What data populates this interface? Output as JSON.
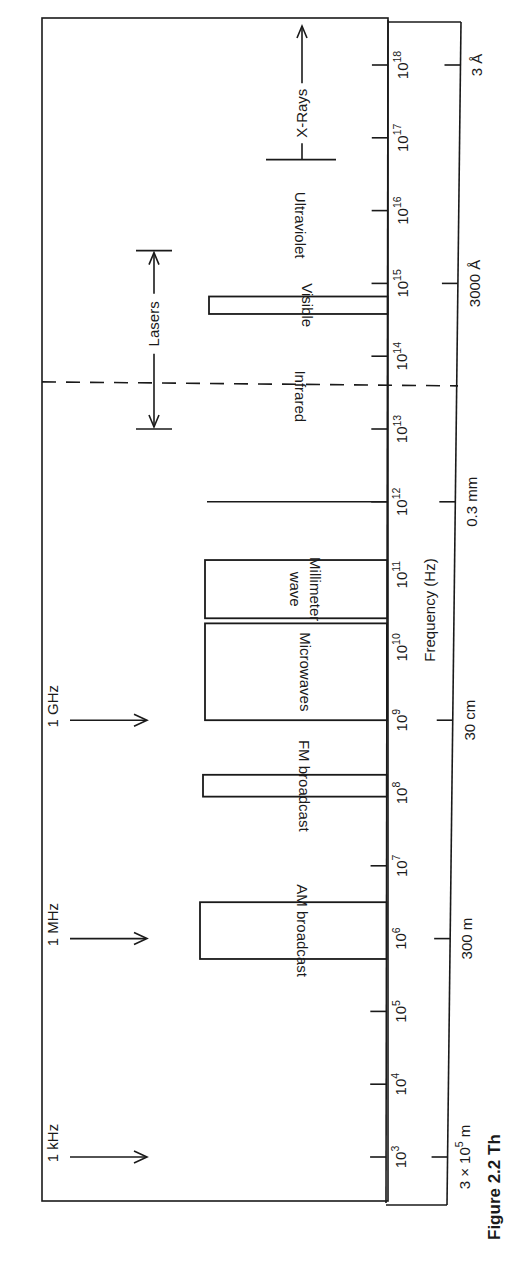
{
  "figure": {
    "caption_partial": "Figure 2.2 Th",
    "orientation": "rotated 90° clockwise on page",
    "frequency_axis": {
      "label": "Frequency (Hz)",
      "scale": "log10",
      "ticks": [
        {
          "exp": 3,
          "label": "10",
          "sup": "3"
        },
        {
          "exp": 4,
          "label": "10",
          "sup": "4"
        },
        {
          "exp": 5,
          "label": "10",
          "sup": "5"
        },
        {
          "exp": 6,
          "label": "10",
          "sup": "6"
        },
        {
          "exp": 7,
          "label": "10",
          "sup": "7"
        },
        {
          "exp": 8,
          "label": "10",
          "sup": "8"
        },
        {
          "exp": 9,
          "label": "10",
          "sup": "9"
        },
        {
          "exp": 10,
          "label": "10",
          "sup": "10"
        },
        {
          "exp": 11,
          "label": "10",
          "sup": "11"
        },
        {
          "exp": 12,
          "label": "10",
          "sup": "12"
        },
        {
          "exp": 13,
          "label": "10",
          "sup": "13"
        },
        {
          "exp": 14,
          "label": "10",
          "sup": "14"
        },
        {
          "exp": 15,
          "label": "10",
          "sup": "15"
        },
        {
          "exp": 16,
          "label": "10",
          "sup": "16"
        },
        {
          "exp": 17,
          "label": "10",
          "sup": "17"
        },
        {
          "exp": 18,
          "label": "10",
          "sup": "18"
        }
      ]
    },
    "wavelength_axis": {
      "ticks": [
        {
          "exp": 3,
          "label": "3 × 10",
          "sup": "5",
          "unit": " m"
        },
        {
          "exp": 6,
          "label": "300 m",
          "sup": "",
          "unit": ""
        },
        {
          "exp": 9,
          "label": "30 cm",
          "sup": "",
          "unit": ""
        },
        {
          "exp": 12,
          "label": "0.3 mm",
          "sup": "",
          "unit": ""
        },
        {
          "exp": 15,
          "label": "3000 Å",
          "sup": "",
          "unit": ""
        },
        {
          "exp": 18,
          "label": "3 Å",
          "sup": "",
          "unit": ""
        }
      ]
    },
    "markers": [
      {
        "label": "1 kHz",
        "exp": 3
      },
      {
        "label": "1 MHz",
        "exp": 6
      },
      {
        "label": "1 GHz",
        "exp": 9
      }
    ],
    "bands": [
      {
        "name": "AM broadcast",
        "lines": [
          "AM broadcast"
        ],
        "from_exp": 5.72,
        "to_exp": 6.5,
        "depth": "tall"
      },
      {
        "name": "FM broadcast",
        "lines": [
          "FM broadcast"
        ],
        "from_exp": 7.95,
        "to_exp": 8.25,
        "depth": "tall2"
      },
      {
        "name": "Microwaves",
        "lines": [
          "Microwaves"
        ],
        "from_exp": 9.0,
        "to_exp": 10.33,
        "depth": "tall3"
      },
      {
        "name": "Millimeter wave",
        "lines": [
          "Millimeter",
          "wave"
        ],
        "from_exp": 10.4,
        "to_exp": 11.2,
        "depth": "tall3"
      },
      {
        "name": "Visible",
        "lines": [
          "Visible"
        ],
        "from_exp": 14.58,
        "to_exp": 14.82,
        "depth": "mid"
      }
    ],
    "far_infrared_line_exp": 12.0,
    "region_labels": [
      {
        "label": "Infrared",
        "exp": 13.45
      },
      {
        "label": "Ultraviolet",
        "exp": 15.8
      }
    ],
    "infrared_boundary_exp": 13.62,
    "lasers": {
      "label": "Lasers",
      "from_exp": 13.0,
      "to_exp": 15.45
    },
    "xrays": {
      "label": "X-Rays",
      "from_exp": 16.7,
      "to_exp": 18.25
    }
  }
}
